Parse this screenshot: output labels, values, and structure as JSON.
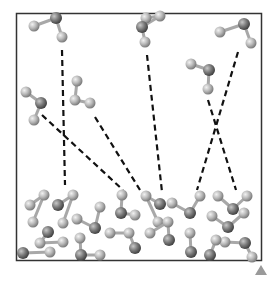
{
  "diagram": {
    "type": "molecular-simulation-snapshot",
    "colors": {
      "frame": "#333333",
      "atom_light": "#b8b8b8",
      "atom_dark": "#7a7a7a",
      "bond": "#a8a8a8",
      "dash": "#111111",
      "marker": "#9a9a9a"
    },
    "frame": {
      "x": 16,
      "y": 13,
      "w": 246,
      "h": 248
    },
    "gas_molecules": [
      {
        "atoms": [
          [
            34,
            26,
            "l"
          ],
          [
            56,
            18,
            "d"
          ],
          [
            62,
            37,
            "l"
          ]
        ]
      },
      {
        "atoms": [
          [
            77,
            81,
            "l"
          ],
          [
            75,
            100,
            "l"
          ],
          [
            90,
            103,
            "l"
          ]
        ]
      },
      {
        "atoms": [
          [
            26,
            92,
            "l"
          ],
          [
            41,
            103,
            "d"
          ],
          [
            34,
            120,
            "l"
          ]
        ]
      },
      {
        "atoms": [
          [
            146,
            18,
            "l"
          ],
          [
            160,
            16,
            "l"
          ],
          [
            142,
            27,
            "d"
          ],
          [
            145,
            42,
            "l"
          ]
        ]
      },
      {
        "atoms": [
          [
            191,
            64,
            "l"
          ],
          [
            209,
            70,
            "d"
          ],
          [
            208,
            89,
            "l"
          ]
        ]
      },
      {
        "atoms": [
          [
            220,
            32,
            "l"
          ],
          [
            244,
            24,
            "d"
          ],
          [
            251,
            43,
            "l"
          ]
        ]
      }
    ],
    "dashed_lines": [
      [
        62,
        50,
        65,
        185
      ],
      [
        42,
        115,
        123,
        190
      ],
      [
        95,
        117,
        140,
        190
      ],
      [
        147,
        55,
        162,
        192
      ],
      [
        208,
        100,
        236,
        190
      ],
      [
        238,
        52,
        197,
        190
      ]
    ],
    "surface_molecules": [
      {
        "atoms": [
          [
            30,
            205,
            "l"
          ],
          [
            44,
            195,
            "l"
          ],
          [
            33,
            222,
            "l"
          ]
        ]
      },
      {
        "atoms": [
          [
            58,
            205,
            "d"
          ],
          [
            73,
            195,
            "l"
          ],
          [
            63,
            223,
            "l"
          ]
        ]
      },
      {
        "atoms": [
          [
            48,
            232,
            "d"
          ],
          [
            40,
            243,
            "l"
          ],
          [
            63,
            242,
            "l"
          ]
        ]
      },
      {
        "atoms": [
          [
            77,
            219,
            "l"
          ],
          [
            95,
            228,
            "d"
          ],
          [
            100,
            207,
            "l"
          ]
        ]
      },
      {
        "atoms": [
          [
            23,
            253,
            "d"
          ],
          [
            50,
            252,
            "l"
          ]
        ]
      },
      {
        "atoms": [
          [
            80,
            238,
            "l"
          ],
          [
            81,
            255,
            "d"
          ],
          [
            100,
            255,
            "l"
          ]
        ]
      },
      {
        "atoms": [
          [
            122,
            195,
            "l"
          ],
          [
            121,
            213,
            "d"
          ],
          [
            135,
            215,
            "l"
          ]
        ]
      },
      {
        "atoms": [
          [
            110,
            233,
            "l"
          ],
          [
            129,
            233,
            "l"
          ],
          [
            135,
            248,
            "d"
          ]
        ]
      },
      {
        "atoms": [
          [
            160,
            204,
            "d"
          ],
          [
            146,
            196,
            "l"
          ],
          [
            158,
            222,
            "l"
          ]
        ]
      },
      {
        "atoms": [
          [
            172,
            203,
            "l"
          ],
          [
            190,
            213,
            "d"
          ],
          [
            200,
            196,
            "l"
          ]
        ]
      },
      {
        "atoms": [
          [
            150,
            233,
            "l"
          ],
          [
            168,
            222,
            "l"
          ],
          [
            169,
            240,
            "d"
          ]
        ]
      },
      {
        "atoms": [
          [
            190,
            233,
            "l"
          ],
          [
            191,
            252,
            "d"
          ]
        ]
      },
      {
        "atoms": [
          [
            218,
            196,
            "l"
          ],
          [
            233,
            209,
            "d"
          ],
          [
            247,
            196,
            "l"
          ]
        ]
      },
      {
        "atoms": [
          [
            212,
            216,
            "l"
          ],
          [
            228,
            227,
            "d"
          ],
          [
            244,
            213,
            "l"
          ]
        ]
      },
      {
        "atoms": [
          [
            225,
            242,
            "l"
          ],
          [
            245,
            243,
            "d"
          ],
          [
            252,
            257,
            "l"
          ]
        ]
      },
      {
        "atoms": [
          [
            210,
            255,
            "d"
          ],
          [
            216,
            240,
            "l"
          ]
        ]
      }
    ],
    "corner_marker": {
      "x": 261,
      "y": 271,
      "shape": "triangle-up"
    }
  }
}
